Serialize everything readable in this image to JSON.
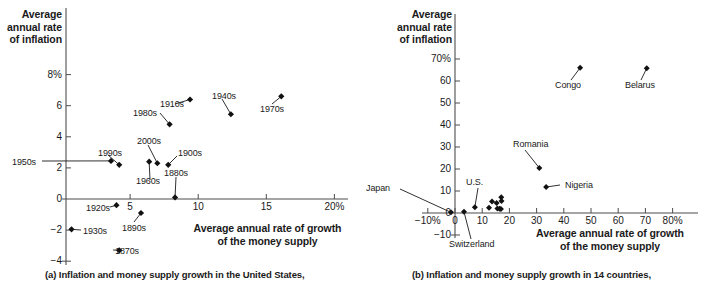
{
  "figure": {
    "panel_a_caption": "(a) Inflation and money supply growth in the United States,",
    "panel_b_caption": "(b) Inflation and money supply growth in 14 countries,"
  },
  "chart_data": [
    {
      "type": "scatter",
      "id": "panel-a",
      "title": "",
      "ylabel": "Average\nannual rate\nof inflation",
      "xlabel": "Average annual rate of growth\nof the money supply",
      "xlim": [
        -1,
        20.5
      ],
      "ylim": [
        -4,
        9
      ],
      "grid": false,
      "legend": "none",
      "xticks": [
        "5",
        "10",
        "15",
        "20%"
      ],
      "xtick_values": [
        5,
        10,
        15,
        20
      ],
      "yticks": [
        "8%",
        "6",
        "4",
        "2",
        "0",
        "−2",
        "−4"
      ],
      "ytick_values": [
        8,
        6,
        4,
        2,
        0,
        -2,
        -4
      ],
      "points": [
        {
          "label": "1870s",
          "x": 4.2,
          "y": -3.3
        },
        {
          "label": "1880s",
          "x": 8.3,
          "y": 0.1
        },
        {
          "label": "1890s",
          "x": 5.8,
          "y": -0.9
        },
        {
          "label": "1900s",
          "x": 7.8,
          "y": 2.2
        },
        {
          "label": "1910s",
          "x": 9.4,
          "y": 6.4
        },
        {
          "label": "1920s",
          "x": 4.0,
          "y": -0.4
        },
        {
          "label": "1930s",
          "x": 0.7,
          "y": -1.95
        },
        {
          "label": "1940s",
          "x": 12.4,
          "y": 5.45
        },
        {
          "label": "1950s",
          "x": 3.6,
          "y": 2.45
        },
        {
          "label": "1960s",
          "x": 6.4,
          "y": 2.4
        },
        {
          "label": "1970s",
          "x": 16.1,
          "y": 6.6
        },
        {
          "label": "1980s",
          "x": 7.9,
          "y": 4.8
        },
        {
          "label": "1990s",
          "x": 4.2,
          "y": 2.2
        },
        {
          "label": "2000s",
          "x": 7.0,
          "y": 2.3
        }
      ]
    },
    {
      "type": "scatter",
      "id": "panel-b",
      "title": "",
      "ylabel": "Average\nannual rate\nof inflation",
      "xlabel": "Average annual rate of growth\nof the money supply",
      "xlim": [
        -12,
        82
      ],
      "ylim": [
        -10,
        75
      ],
      "grid": false,
      "legend": "none",
      "xticks": [
        "−10%",
        "0",
        "10",
        "20",
        "30",
        "40",
        "50",
        "60",
        "70",
        "80%"
      ],
      "xtick_values": [
        -10,
        0,
        10,
        20,
        30,
        40,
        50,
        60,
        70,
        80
      ],
      "yticks": [
        "70%",
        "60",
        "50",
        "40",
        "30",
        "20",
        "10",
        "0",
        "−10"
      ],
      "ytick_values": [
        70,
        60,
        50,
        40,
        30,
        20,
        10,
        0,
        -10
      ],
      "points": [
        {
          "label": "Japan",
          "x": -1.5,
          "y": 0.3
        },
        {
          "label": "Switzerland",
          "x": 3.3,
          "y": 0.6
        },
        {
          "label": "U.S.",
          "x": 7.3,
          "y": 2.6
        },
        {
          "label": "",
          "x": 12.5,
          "y": 2.4
        },
        {
          "label": "",
          "x": 13.6,
          "y": 5.2
        },
        {
          "label": "",
          "x": 15.3,
          "y": 4.6
        },
        {
          "label": "",
          "x": 15.6,
          "y": 2.1
        },
        {
          "label": "",
          "x": 16.4,
          "y": 1.9
        },
        {
          "label": "",
          "x": 16.9,
          "y": 1.8
        },
        {
          "label": "",
          "x": 17.0,
          "y": 7.2
        },
        {
          "label": "",
          "x": 17.1,
          "y": 5.4
        },
        {
          "label": "Nigeria",
          "x": 33.5,
          "y": 11.8
        },
        {
          "label": "Romania",
          "x": 31.0,
          "y": 20.5
        },
        {
          "label": "Congo",
          "x": 46.0,
          "y": 66.0
        },
        {
          "label": "Belarus",
          "x": 70.5,
          "y": 65.8
        }
      ]
    }
  ]
}
